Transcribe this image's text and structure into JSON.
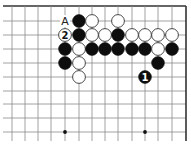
{
  "diagram": {
    "type": "go-board-fragment",
    "grid": {
      "columns_x": [
        12,
        25,
        38,
        51,
        65,
        79,
        92,
        105,
        118,
        132,
        145,
        158,
        172,
        186
      ],
      "rows_y": [
        6,
        21,
        35,
        49,
        63,
        77,
        91,
        104,
        118,
        132
      ],
      "line_left": 3,
      "line_bottom": 141,
      "top_edge_row": 0,
      "right_edge_col": 13
    },
    "star_points": [
      {
        "col": 4,
        "row": 9
      },
      {
        "col": 10,
        "row": 9
      }
    ],
    "stones": [
      {
        "col": 5,
        "row": 1,
        "color": "black"
      },
      {
        "col": 6,
        "row": 1,
        "color": "white"
      },
      {
        "col": 8,
        "row": 1,
        "color": "white"
      },
      {
        "col": 4,
        "row": 2,
        "color": "white",
        "label": "2"
      },
      {
        "col": 5,
        "row": 2,
        "color": "black"
      },
      {
        "col": 6,
        "row": 2,
        "color": "white"
      },
      {
        "col": 7,
        "row": 2,
        "color": "white"
      },
      {
        "col": 8,
        "row": 2,
        "color": "black"
      },
      {
        "col": 9,
        "row": 2,
        "color": "white"
      },
      {
        "col": 10,
        "row": 2,
        "color": "white"
      },
      {
        "col": 11,
        "row": 2,
        "color": "white"
      },
      {
        "col": 12,
        "row": 2,
        "color": "white"
      },
      {
        "col": 4,
        "row": 3,
        "color": "black"
      },
      {
        "col": 5,
        "row": 3,
        "color": "white"
      },
      {
        "col": 6,
        "row": 3,
        "color": "black"
      },
      {
        "col": 7,
        "row": 3,
        "color": "black"
      },
      {
        "col": 8,
        "row": 3,
        "color": "black"
      },
      {
        "col": 9,
        "row": 3,
        "color": "black"
      },
      {
        "col": 10,
        "row": 3,
        "color": "black"
      },
      {
        "col": 11,
        "row": 3,
        "color": "white"
      },
      {
        "col": 12,
        "row": 3,
        "color": "black"
      },
      {
        "col": 4,
        "row": 4,
        "color": "black"
      },
      {
        "col": 5,
        "row": 4,
        "color": "white"
      },
      {
        "col": 11,
        "row": 4,
        "color": "black"
      },
      {
        "col": 5,
        "row": 5,
        "color": "white"
      },
      {
        "col": 10,
        "row": 5,
        "color": "black",
        "label": "1"
      }
    ],
    "markers": [
      {
        "col": 4,
        "row": 1,
        "text": "A"
      }
    ],
    "colors": {
      "black_stone": "#0d0d0d",
      "white_stone": "#ffffff",
      "line": "#8a8a8a",
      "edge": "#333333"
    }
  }
}
